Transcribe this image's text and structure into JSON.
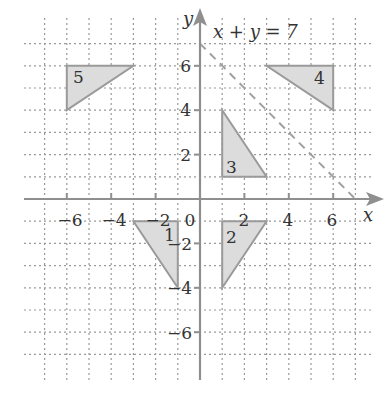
{
  "figure": {
    "type": "coordinate-grid",
    "x_axis_label": "x",
    "y_axis_label": "y",
    "origin_label": "0",
    "line_label": "x + y = 7",
    "x_tick_labels": [
      "−6",
      "−4",
      "−2",
      "2",
      "4",
      "6"
    ],
    "y_tick_labels": [
      "6",
      "4",
      "2",
      "−2",
      "−4",
      "−6"
    ],
    "colors": {
      "grid": "#9a9a9a",
      "axis": "#8f8f8f",
      "triangle_fill": "#dcdcdc",
      "triangle_stroke": "#9a9a9a",
      "dashed_line": "#a0a0a0",
      "text": "#333333"
    },
    "triangles": [
      {
        "label": "1",
        "vertices": [
          [
            -3,
            -1
          ],
          [
            -1,
            -1
          ],
          [
            -1,
            -4
          ]
        ]
      },
      {
        "label": "2",
        "vertices": [
          [
            1,
            -1
          ],
          [
            3,
            -1
          ],
          [
            1,
            -4
          ]
        ]
      },
      {
        "label": "3",
        "vertices": [
          [
            1,
            4
          ],
          [
            1,
            1
          ],
          [
            3,
            1
          ]
        ]
      },
      {
        "label": "4",
        "vertices": [
          [
            3,
            6
          ],
          [
            6,
            6
          ],
          [
            6,
            4
          ]
        ]
      },
      {
        "label": "5",
        "vertices": [
          [
            -6,
            6
          ],
          [
            -3,
            6
          ],
          [
            -6,
            4
          ]
        ]
      }
    ],
    "line": {
      "equation": "x + y = 7",
      "from": [
        0,
        7
      ],
      "to": [
        7,
        0
      ],
      "style": "dashed"
    }
  }
}
